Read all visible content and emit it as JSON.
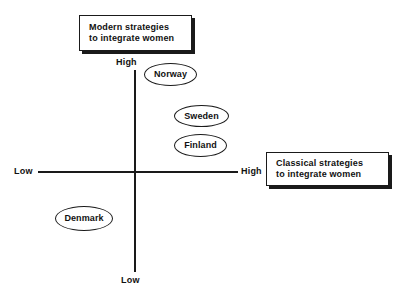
{
  "chart_data": {
    "type": "scatter",
    "title": "",
    "xlabel": "Classical strategies to integrate women",
    "ylabel": "Modern strategies to integrate women",
    "x_ticks": [
      "Low",
      "High"
    ],
    "y_ticks": [
      "Low",
      "High"
    ],
    "grid": false,
    "legend": "none",
    "axis_style": "quadrant-cross",
    "xlim": [
      "Low",
      "High"
    ],
    "ylim": [
      "Low",
      "High"
    ],
    "points": [
      {
        "label": "Norway",
        "x": 0.3,
        "y": 0.95
      },
      {
        "label": "Sweden",
        "x": 0.59,
        "y": 0.63
      },
      {
        "label": "Finland",
        "x": 0.57,
        "y": 0.48
      },
      {
        "label": "Denmark",
        "x": -0.6,
        "y": -0.35
      }
    ],
    "annotations": [
      {
        "text": "Modern strategies to integrate women",
        "anchor": "y-axis-high"
      },
      {
        "text": "Classical strategies to integrate women",
        "anchor": "x-axis-high"
      }
    ]
  },
  "axes": {
    "vertical": {
      "high_label": "High",
      "low_label": "Low"
    },
    "horizontal": {
      "low_label": "Low",
      "high_label": "High"
    }
  },
  "nodes": {
    "norway": "Norway",
    "sweden": "Sweden",
    "finland": "Finland",
    "denmark": "Denmark"
  },
  "callouts": {
    "modern": {
      "line1": "Modern strategies",
      "line2": "to integrate women"
    },
    "classical": {
      "line1": "Classical strategies",
      "line2": "to integrate women"
    }
  },
  "colors": {
    "ink": "#1a1a1a",
    "paper": "#ffffff"
  }
}
